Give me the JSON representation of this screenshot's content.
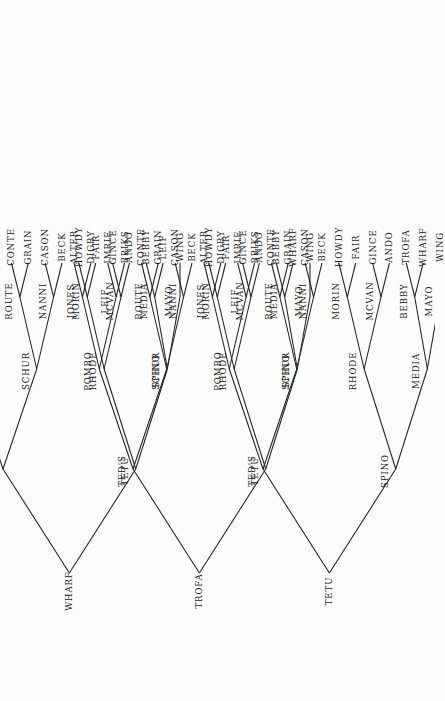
{
  "figure": {
    "kind": "three-cladogram-panel",
    "orientation_note": "page-rotated-90",
    "leaf_row_labels": [
      "ALTER",
      "DIGBY",
      "IMRIE",
      "BRIKS",
      "CONTE",
      "GRAIN",
      "CASON",
      "BECK",
      "HOWDY",
      "FAIR",
      "GINCE",
      "ANDO",
      "BEBBY",
      "LEIF",
      "WING"
    ],
    "ink_color": "#20201e",
    "paper_color": "#fdfdfd"
  },
  "trees": [
    {
      "id": "tree-1",
      "root": "WHARF",
      "internal_nodes": [
        "WHARF",
        "TETU",
        "TROFA",
        "TED'S",
        "SCHUR",
        "RHODE",
        "SPINO",
        "JONES",
        "POMBO",
        "ROUTE",
        "NANNI",
        "MORIN",
        "MCVAN",
        "MEDIA",
        "MAYO"
      ],
      "leaves": [
        "ALTER",
        "DIGBY",
        "IMRIE",
        "BRIKS",
        "CONTE",
        "GRAIN",
        "CASON",
        "BECK",
        "HOWDY",
        "FAIR",
        "GINCE",
        "ANDO",
        "BEBBY",
        "LEIF",
        "WING"
      ],
      "nodes": {
        "root": {
          "label": "WHARF"
        },
        "l": {
          "label": "TROFA"
        },
        "r": {
          "label": "TETU"
        },
        "ll": {
          "label": "TED'S"
        },
        "lr": {
          "label": "SCHUR"
        },
        "rl": {
          "label": "RHODE"
        },
        "rr": {
          "label": "SPINO"
        },
        "lll": {
          "label": "JONES"
        },
        "llr": {
          "label": "POMBO"
        },
        "lrl": {
          "label": "ROUTE"
        },
        "lrr": {
          "label": "NANNI"
        },
        "rll": {
          "label": "MORIN"
        },
        "rlr": {
          "label": "MCVAN"
        },
        "rrl": {
          "label": "MEDIA"
        },
        "rrr": {
          "label": "MAYO"
        }
      },
      "tips": {
        "t0": {
          "label": "ALTER"
        },
        "t1": {
          "label": "DIGBY"
        },
        "t2": {
          "label": "IMRIE"
        },
        "t3": {
          "label": "BRIKS"
        },
        "t4": {
          "label": "CONTE"
        },
        "t5": {
          "label": "GRAIN"
        },
        "t6": {
          "label": "CASON"
        },
        "t7": {
          "label": "BECK"
        },
        "t8": {
          "label": "HOWDY"
        },
        "t9": {
          "label": "FAIR"
        },
        "t10": {
          "label": "GINCE"
        },
        "t11": {
          "label": "ANDO"
        },
        "t12": {
          "label": "BEBBY"
        },
        "t13": {
          "label": "LEIF"
        },
        "t14": {
          "label": "WING"
        }
      }
    },
    {
      "id": "tree-2",
      "root": "TROFA",
      "internal_nodes": [
        "TROFA",
        "TED'S",
        "TETU",
        "POMBO",
        "SCHUR",
        "RHODE",
        "SPINO",
        "JONES",
        "LEIF",
        "ROUTE",
        "NANNI",
        "MORIN",
        "MCVAN",
        "MEDIA",
        "MAYO"
      ],
      "leaves": [
        "ALTER",
        "DIGBY",
        "IMRIE",
        "BRIKS",
        "CONTE",
        "GRAIN",
        "CASON",
        "BECK",
        "HOWDY",
        "FAIR",
        "GINCE",
        "ANDO",
        "BEBBY",
        "WHARF",
        "WING"
      ],
      "nodes": {
        "root": {
          "label": "TROFA"
        },
        "l": {
          "label": "TED'S"
        },
        "r": {
          "label": "TETU"
        },
        "ll": {
          "label": "POMBO"
        },
        "lr": {
          "label": "SCHUR"
        },
        "rl": {
          "label": "RHODE"
        },
        "rr": {
          "label": "SPINO"
        },
        "lll": {
          "label": "JONES"
        },
        "llr": {
          "label": "LEIF"
        },
        "lrl": {
          "label": "ROUTE"
        },
        "lrr": {
          "label": "NANNI"
        },
        "rll": {
          "label": "MORIN"
        },
        "rlr": {
          "label": "MCVAN"
        },
        "rrl": {
          "label": "MEDIA"
        },
        "rrr": {
          "label": "MAYO"
        }
      },
      "tips": {
        "t0": {
          "label": "ALTER"
        },
        "t1": {
          "label": "DIGBY"
        },
        "t2": {
          "label": "IMRIE"
        },
        "t3": {
          "label": "BRIKS"
        },
        "t4": {
          "label": "CONTE"
        },
        "t5": {
          "label": "GRAIN"
        },
        "t6": {
          "label": "CASON"
        },
        "t7": {
          "label": "BECK"
        },
        "t8": {
          "label": "HOWDY"
        },
        "t9": {
          "label": "FAIR"
        },
        "t10": {
          "label": "GINCE"
        },
        "t11": {
          "label": "ANDO"
        },
        "t12": {
          "label": "BEBBY"
        },
        "t13": {
          "label": "WHARF"
        },
        "t14": {
          "label": "WING"
        }
      }
    },
    {
      "id": "tree-3",
      "root": "TETU",
      "internal_nodes": [
        "TETU",
        "TED'S",
        "SPINO",
        "POMBO",
        "SCHUR",
        "RHODE",
        "MEDIA",
        "JONES",
        "LEIF",
        "ROUTE",
        "NANNI",
        "MORIN",
        "MCVAN",
        "BEBBY",
        "MAYO"
      ],
      "leaves": [
        "ALTER",
        "DIGBY",
        "IMRIE",
        "BRIKS",
        "CONTE",
        "GRAIN",
        "CASON",
        "BECK",
        "HOWDY",
        "FAIR",
        "GINCE",
        "ANDO",
        "TROFA",
        "WHARF",
        "WING"
      ],
      "nodes": {
        "root": {
          "label": "TETU"
        },
        "l": {
          "label": "TED'S"
        },
        "r": {
          "label": "SPINO"
        },
        "ll": {
          "label": "POMBO"
        },
        "lr": {
          "label": "SCHUR"
        },
        "rl": {
          "label": "RHODE"
        },
        "rr": {
          "label": "MEDIA"
        },
        "lll": {
          "label": "JONES"
        },
        "llr": {
          "label": "LEIF"
        },
        "lrl": {
          "label": "ROUTE"
        },
        "lrr": {
          "label": "NANNI"
        },
        "rll": {
          "label": "MORIN"
        },
        "rlr": {
          "label": "MCVAN"
        },
        "rrl": {
          "label": "BEBBY"
        },
        "rrr": {
          "label": "MAYO"
        }
      },
      "tips": {
        "t0": {
          "label": "ALTER"
        },
        "t1": {
          "label": "DIGBY"
        },
        "t2": {
          "label": "IMRIE"
        },
        "t3": {
          "label": "BRIKS"
        },
        "t4": {
          "label": "CONTE"
        },
        "t5": {
          "label": "GRAIN"
        },
        "t6": {
          "label": "CASON"
        },
        "t7": {
          "label": "BECK"
        },
        "t8": {
          "label": "HOWDY"
        },
        "t9": {
          "label": "FAIR"
        },
        "t10": {
          "label": "GINCE"
        },
        "t11": {
          "label": "ANDO"
        },
        "t12": {
          "label": "TROFA"
        },
        "t13": {
          "label": "WHARF"
        },
        "t14": {
          "label": "WING"
        }
      }
    }
  ]
}
